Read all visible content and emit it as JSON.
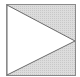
{
  "icon": {
    "name": "play-icon",
    "border_color": "#8a8a8a",
    "fill_color": "#d6d6d6",
    "triangle_color": "#ffffff"
  }
}
